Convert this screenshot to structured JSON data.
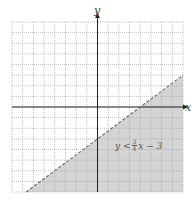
{
  "chart_data": {
    "type": "area",
    "title": "",
    "xlabel": "x",
    "ylabel": "y",
    "xlim": [
      -8,
      8
    ],
    "ylim": [
      -8,
      8
    ],
    "grid": true,
    "grid_step": 1,
    "boundary": {
      "equation": "y = (3/4)x - 3",
      "slope": 0.75,
      "intercept": -3,
      "style": "dashed"
    },
    "shaded_region": "below boundary line",
    "inequality_label": "y < 3/4 x − 3",
    "points_on_boundary": [
      {
        "x": -6.67,
        "y": -8
      },
      {
        "x": 0,
        "y": -3
      },
      {
        "x": 4,
        "y": 0
      },
      {
        "x": 8,
        "y": 3
      }
    ]
  },
  "labels": {
    "x_axis": "x",
    "y_axis": "y",
    "inequality_lhs": "y <",
    "frac_num": "3",
    "frac_den": "4",
    "inequality_rhs": "x − 3"
  },
  "colors": {
    "shade": "#d4d4d4",
    "grid": "#a8a8a8",
    "axis": "#222222",
    "boundary": "#666666"
  }
}
